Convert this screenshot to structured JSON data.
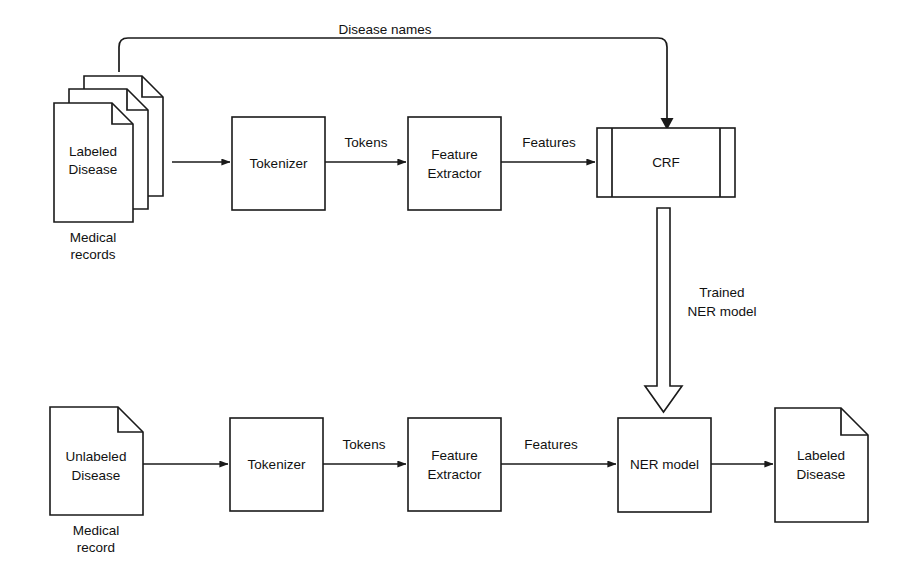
{
  "diagram": {
    "colors": {
      "background": "#ffffff",
      "stroke": "#1a1a1a",
      "text": "#111111",
      "fill": "#ffffff"
    },
    "training_row": {
      "source": {
        "line1": "Labeled",
        "line2": "Disease",
        "caption_line1": "Medical",
        "caption_line2": "records"
      },
      "tokenizer": {
        "label": "Tokenizer"
      },
      "edge_tokens": {
        "label": "Tokens"
      },
      "feature_extractor": {
        "line1": "Feature",
        "line2": "Extractor"
      },
      "edge_features": {
        "label": "Features"
      },
      "crf": {
        "label": "CRF"
      }
    },
    "feedback": {
      "label": "Disease names"
    },
    "model_transfer": {
      "line1": "Trained",
      "line2": "NER model"
    },
    "inference_row": {
      "source": {
        "line1": "Unlabeled",
        "line2": "Disease",
        "caption_line1": "Medical",
        "caption_line2": "record"
      },
      "tokenizer": {
        "label": "Tokenizer"
      },
      "edge_tokens": {
        "label": "Tokens"
      },
      "feature_extractor": {
        "line1": "Feature",
        "line2": "Extractor"
      },
      "edge_features": {
        "label": "Features"
      },
      "ner_model": {
        "label": "NER model"
      },
      "output": {
        "line1": "Labeled",
        "line2": "Disease"
      }
    }
  }
}
